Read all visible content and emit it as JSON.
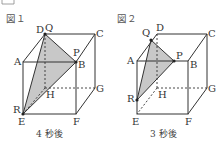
{
  "figures": [
    {
      "title": "図１",
      "caption": "4 秒後",
      "labels": {
        "Q": "Q",
        "D": "D",
        "C": "C",
        "A": "A",
        "P": "P",
        "B": "B",
        "H": "H",
        "G": "G",
        "R": "R",
        "E": "E",
        "F": "F"
      }
    },
    {
      "title": "図２",
      "caption": "3 秒後",
      "labels": {
        "Q": "Q",
        "D": "D",
        "C": "C",
        "A": "A",
        "P": "P",
        "B": "B",
        "H": "H",
        "G": "G",
        "R": "R",
        "E": "E",
        "F": "F"
      }
    }
  ],
  "colors": {
    "line": "#333333",
    "shade": "#c8c8c8"
  }
}
